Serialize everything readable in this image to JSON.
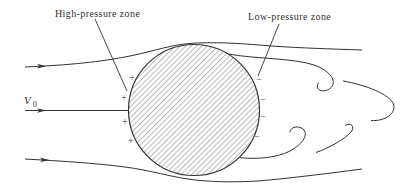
{
  "diagram": {
    "labels": {
      "high_pressure": "High-pressure zone",
      "low_pressure": "Low-pressure zone"
    },
    "velocity": {
      "symbol": "V",
      "subscript": "0"
    },
    "pressure_markers": {
      "plus": "+",
      "minus": "−",
      "plus_count": 4,
      "minus_count": 4
    },
    "colors": {
      "ink": "#333333",
      "hatch": "#4a4a4a",
      "background": "#ffffff"
    }
  }
}
